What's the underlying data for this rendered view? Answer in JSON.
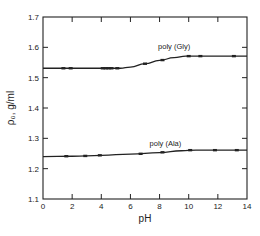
{
  "chart_data": {
    "type": "line",
    "title": "",
    "xlabel": "pH",
    "ylabel": "ρ₀, g/ml",
    "xlim": [
      0,
      14
    ],
    "ylim": [
      1.1,
      1.7
    ],
    "xticks": [
      0,
      2,
      4,
      6,
      8,
      10,
      12,
      14
    ],
    "xtick_labels": [
      "0",
      "2",
      "4",
      "6",
      "8",
      "10",
      "12",
      "14"
    ],
    "yticks": [
      1.1,
      1.2,
      1.3,
      1.4,
      1.5,
      1.6,
      1.7
    ],
    "ytick_labels": [
      "1.1",
      "1.2",
      "1.3",
      "1.4",
      "1.5",
      "1.6",
      "1.7"
    ],
    "grid": false,
    "legend": "inline labels above curves",
    "series": [
      {
        "name": "poly (Gly)",
        "label_pos": {
          "x": 9.0,
          "y": 1.595
        },
        "curve": [
          [
            0,
            1.531
          ],
          [
            5.3,
            1.531
          ],
          [
            6.0,
            1.535
          ],
          [
            7.0,
            1.546
          ],
          [
            8.0,
            1.557
          ],
          [
            9.0,
            1.566
          ],
          [
            9.8,
            1.571
          ],
          [
            14,
            1.571
          ]
        ],
        "points": [
          [
            1.4,
            1.531
          ],
          [
            1.9,
            1.531
          ],
          [
            4.1,
            1.531
          ],
          [
            4.3,
            1.531
          ],
          [
            4.5,
            1.531
          ],
          [
            4.7,
            1.531
          ],
          [
            5.1,
            1.531
          ],
          [
            7.0,
            1.546
          ],
          [
            8.2,
            1.558
          ],
          [
            10.0,
            1.571
          ],
          [
            10.8,
            1.571
          ],
          [
            13.1,
            1.571
          ]
        ]
      },
      {
        "name": "poly (Ala)",
        "label_pos": {
          "x": 8.4,
          "y": 1.275
        },
        "curve": [
          [
            0,
            1.24
          ],
          [
            2.0,
            1.241
          ],
          [
            4.0,
            1.244
          ],
          [
            6.0,
            1.248
          ],
          [
            8.0,
            1.253
          ],
          [
            9.5,
            1.259
          ],
          [
            10.5,
            1.261
          ],
          [
            14,
            1.261
          ]
        ],
        "points": [
          [
            1.6,
            1.241
          ],
          [
            2.9,
            1.242
          ],
          [
            3.9,
            1.244
          ],
          [
            6.7,
            1.249
          ],
          [
            8.2,
            1.254
          ],
          [
            10.1,
            1.261
          ],
          [
            11.8,
            1.261
          ],
          [
            13.3,
            1.261
          ]
        ]
      }
    ]
  }
}
